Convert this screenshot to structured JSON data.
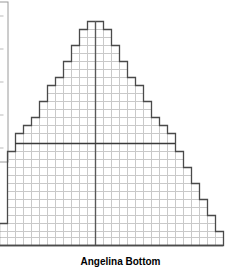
{
  "figure": {
    "caption": "Angelina Bottom",
    "caption_top_px": 256,
    "caption_font_size_px": 10,
    "width_px": 241,
    "height_px": 270,
    "background_color": "#ffffff",
    "outline_color": "#4a4a4a",
    "grid_color": "#c9c9c9",
    "axis_color": "#585858",
    "side_panel_border_color": "#9a9a9a"
  },
  "side_panel": {
    "label": "clipped-legend-box",
    "x_px": 0,
    "y_px": 2,
    "width_px": 8,
    "height_px": 160,
    "tick_count": 5
  },
  "axes": {
    "center_line_x_px": 95,
    "center_line_color": "#585858",
    "center_line_width_px": 1.4,
    "midline_y_px": 143,
    "midline_color": "#3a3a3a",
    "midline_width_px": 1.4,
    "baseline_y_px": 245
  },
  "chart_data": {
    "type": "bar",
    "title": "Angelina Bottom",
    "xlabel": "",
    "ylabel": "",
    "orientation": "horizontal-stepped-pyramid",
    "cell_width_px": 8,
    "cell_height_px": 8,
    "origin_x_px": 95,
    "baseline_y_px": 245,
    "grid": true,
    "legend": "none",
    "note": "Stepped pyramid: each row is a horizontal bar spanning left and right of the center axis, measured in grid cells.",
    "rows": [
      {
        "index": 0,
        "y_top_px": 21,
        "y_bottom_px": 29,
        "left_cells": 1,
        "right_cells": 1
      },
      {
        "index": 1,
        "y_top_px": 29,
        "y_bottom_px": 37,
        "left_cells": 2,
        "right_cells": 2
      },
      {
        "index": 2,
        "y_top_px": 37,
        "y_bottom_px": 45,
        "left_cells": 2,
        "right_cells": 2
      },
      {
        "index": 3,
        "y_top_px": 45,
        "y_bottom_px": 53,
        "left_cells": 3,
        "right_cells": 3
      },
      {
        "index": 4,
        "y_top_px": 53,
        "y_bottom_px": 61,
        "left_cells": 3,
        "right_cells": 3
      },
      {
        "index": 5,
        "y_top_px": 61,
        "y_bottom_px": 69,
        "left_cells": 4,
        "right_cells": 4
      },
      {
        "index": 6,
        "y_top_px": 69,
        "y_bottom_px": 77,
        "left_cells": 4,
        "right_cells": 4
      },
      {
        "index": 7,
        "y_top_px": 77,
        "y_bottom_px": 85,
        "left_cells": 5,
        "right_cells": 5
      },
      {
        "index": 8,
        "y_top_px": 85,
        "y_bottom_px": 93,
        "left_cells": 6,
        "right_cells": 6
      },
      {
        "index": 9,
        "y_top_px": 93,
        "y_bottom_px": 101,
        "left_cells": 6,
        "right_cells": 6
      },
      {
        "index": 10,
        "y_top_px": 101,
        "y_bottom_px": 109,
        "left_cells": 7,
        "right_cells": 7
      },
      {
        "index": 11,
        "y_top_px": 109,
        "y_bottom_px": 117,
        "left_cells": 7,
        "right_cells": 7
      },
      {
        "index": 12,
        "y_top_px": 117,
        "y_bottom_px": 125,
        "left_cells": 8,
        "right_cells": 8
      },
      {
        "index": 13,
        "y_top_px": 125,
        "y_bottom_px": 133,
        "left_cells": 9,
        "right_cells": 9
      },
      {
        "index": 14,
        "y_top_px": 133,
        "y_bottom_px": 143,
        "left_cells": 10,
        "right_cells": 10
      },
      {
        "index": 15,
        "y_top_px": 143,
        "y_bottom_px": 151,
        "left_cells": 10,
        "right_cells": 10
      },
      {
        "index": 16,
        "y_top_px": 151,
        "y_bottom_px": 159,
        "left_cells": 11,
        "right_cells": 11
      },
      {
        "index": 17,
        "y_top_px": 159,
        "y_bottom_px": 167,
        "left_cells": 11,
        "right_cells": 11
      },
      {
        "index": 18,
        "y_top_px": 167,
        "y_bottom_px": 175,
        "left_cells": 11,
        "right_cells": 12
      },
      {
        "index": 19,
        "y_top_px": 175,
        "y_bottom_px": 183,
        "left_cells": 11,
        "right_cells": 12
      },
      {
        "index": 20,
        "y_top_px": 183,
        "y_bottom_px": 191,
        "left_cells": 11,
        "right_cells": 13
      },
      {
        "index": 21,
        "y_top_px": 191,
        "y_bottom_px": 199,
        "left_cells": 11,
        "right_cells": 13
      },
      {
        "index": 22,
        "y_top_px": 199,
        "y_bottom_px": 207,
        "left_cells": 11,
        "right_cells": 14
      },
      {
        "index": 23,
        "y_top_px": 207,
        "y_bottom_px": 215,
        "left_cells": 11,
        "right_cells": 14
      },
      {
        "index": 24,
        "y_top_px": 215,
        "y_bottom_px": 223,
        "left_cells": 11,
        "right_cells": 15
      },
      {
        "index": 25,
        "y_top_px": 223,
        "y_bottom_px": 231,
        "left_cells": 12,
        "right_cells": 15
      },
      {
        "index": 26,
        "y_top_px": 231,
        "y_bottom_px": 237,
        "left_cells": 12,
        "right_cells": 16
      },
      {
        "index": 27,
        "y_top_px": 237,
        "y_bottom_px": 245,
        "left_cells": 12,
        "right_cells": 16
      }
    ]
  }
}
